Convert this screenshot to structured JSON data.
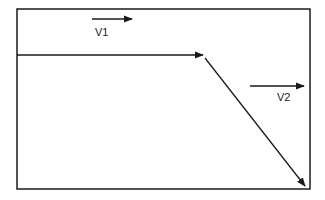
{
  "diagram": {
    "colors": {
      "stroke": "#1a1a1a",
      "background": "#ffffff"
    },
    "frame": {
      "x": 17,
      "y": 9,
      "width": 293,
      "height": 180
    },
    "flow_lines": [
      {
        "id": "horizontal-flow",
        "from": [
          17,
          55
        ],
        "to": [
          203,
          55
        ],
        "arrowhead": true
      },
      {
        "id": "diagonal-flow",
        "from": [
          205,
          58
        ],
        "to": [
          305,
          186
        ],
        "arrowhead": true
      }
    ],
    "velocity_vectors": [
      {
        "id": "v1",
        "label": "V1",
        "from": [
          92,
          19
        ],
        "to": [
          132,
          19
        ],
        "label_pos": [
          95,
          36
        ]
      },
      {
        "id": "v2",
        "label": "V2",
        "from": [
          250,
          86
        ],
        "to": [
          304,
          86
        ],
        "label_pos": [
          277,
          101
        ]
      }
    ]
  }
}
